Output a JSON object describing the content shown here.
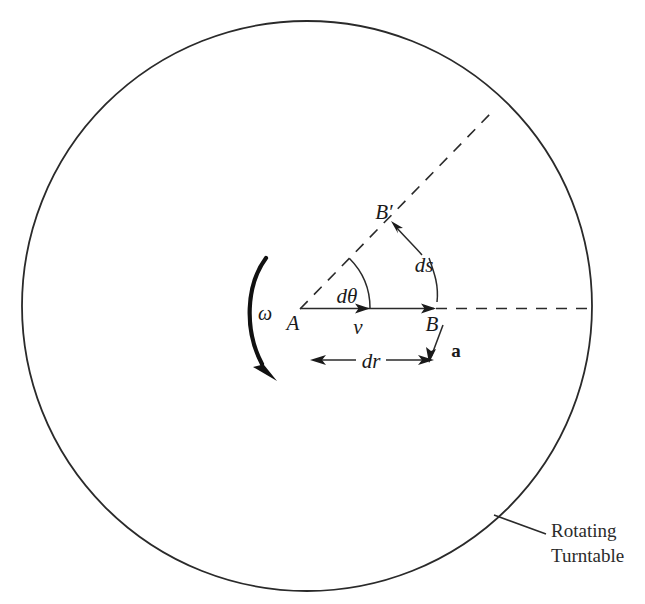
{
  "figure": {
    "background_color": "#ffffff",
    "stroke_color": "#1a1a1a"
  },
  "turntable": {
    "shape": "circle",
    "center_x": 307,
    "center_y": 306,
    "radius": 285,
    "label_line1": "Rotating",
    "label_line2": "Turntable",
    "label_x": 548,
    "label_y": 538
  },
  "points": {
    "center_label": "A",
    "center_x": 300,
    "center_y": 309,
    "b_label": "B",
    "b_x": 433,
    "b_y": 309,
    "b_prime_label": "B′",
    "b_prime_x": 386,
    "b_prime_y": 214
  },
  "vectors": {
    "velocity_label": "v",
    "velocity_x": 357,
    "velocity_y": 330,
    "acceleration_label": "a",
    "acceleration_x": 456,
    "acceleration_y": 351
  },
  "annotations": {
    "omega_label": "ω",
    "omega_x": 263,
    "omega_y": 318,
    "d_theta_label": "dθ",
    "d_theta_x": 347,
    "d_theta_y": 300,
    "ds_label": "ds",
    "ds_x": 424,
    "ds_y": 269,
    "dr_label": "dr",
    "dr_x": 371,
    "dr_y": 367
  },
  "geometry": {
    "radius_line_angle_deg": -45.9,
    "radius_dashed_end_x": 492,
    "radius_dashed_end_y": 112,
    "horizontal_dashed_end_x": 592,
    "horizontal_dashed_end_y": 308,
    "dr_left_x": 312,
    "dr_right_x": 432,
    "dr_y": 360
  }
}
